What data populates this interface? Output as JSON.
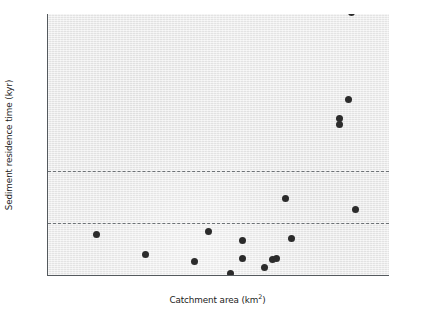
{
  "chart_data": {
    "type": "scatter",
    "title": "",
    "xlabel": "Catchment area (km²)",
    "ylabel": "Sediment residence time (kyr)",
    "xscale": "log",
    "yscale": "linear",
    "xlim": [
      1,
      10000000
    ],
    "ylim": [
      0,
      25
    ],
    "grid": false,
    "legend": null,
    "marker": {
      "shape": "circle",
      "color": "#2b2b2b",
      "size_px": 7
    },
    "background_color": "#ececec",
    "axis_color": "#555a5e",
    "xticks": [
      1,
      10,
      100,
      1000,
      10000,
      100000,
      1000000,
      10000000
    ],
    "xtick_labels": [
      "1",
      "10",
      "100",
      "1,000",
      "10,000",
      "100,000",
      "1,000,000",
      "10,000,000"
    ],
    "yticks": [
      0,
      5,
      10,
      15,
      20,
      25
    ],
    "ytick_labels": [
      "0",
      "5",
      "10",
      "15",
      "20",
      "25"
    ],
    "yticks_minor": [
      2.5,
      7.5,
      12.5,
      17.5,
      22.5
    ],
    "reference_lines": [
      {
        "name": "upper-reference-line",
        "y": 10,
        "style": "dashed",
        "color": "#6d7276"
      },
      {
        "name": "lower-reference-line",
        "y": 5,
        "style": "dashed",
        "color": "#6d7276"
      }
    ],
    "points": [
      {
        "x": 10,
        "y": 3.9
      },
      {
        "x": 100,
        "y": 2.0
      },
      {
        "x": 1000,
        "y": 1.25
      },
      {
        "x": 2000,
        "y": 4.2
      },
      {
        "x": 5500,
        "y": 0.15
      },
      {
        "x": 10000,
        "y": 3.3
      },
      {
        "x": 10000,
        "y": 1.55
      },
      {
        "x": 28000,
        "y": 0.75
      },
      {
        "x": 40000,
        "y": 1.5
      },
      {
        "x": 48000,
        "y": 1.55
      },
      {
        "x": 75000,
        "y": 7.3
      },
      {
        "x": 100000,
        "y": 3.5
      },
      {
        "x": 950000,
        "y": 15.0
      },
      {
        "x": 950000,
        "y": 14.4
      },
      {
        "x": 1500000,
        "y": 16.8
      },
      {
        "x": 2100000,
        "y": 6.3
      },
      {
        "x": 1700000,
        "y": 25.1
      }
    ]
  }
}
